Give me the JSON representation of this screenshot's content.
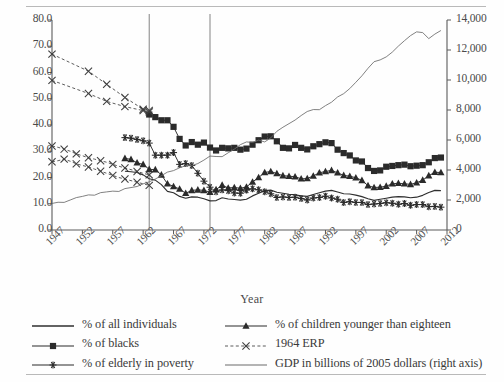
{
  "figure": {
    "axis_title": "Year",
    "left_axis": {
      "ticks": [
        "0.0",
        "10.0",
        "20.0",
        "30.0",
        "40.0",
        "50.0",
        "60.0",
        "70.0",
        "80.0"
      ],
      "min": 0,
      "max": 80,
      "step": 10
    },
    "right_axis": {
      "ticks": [
        "0",
        "2,000",
        "4,000",
        "6,000",
        "8,000",
        "10,000",
        "12,000",
        "14,000"
      ],
      "min": 0,
      "max": 14000,
      "step": 2000
    },
    "x_axis": {
      "ticks": [
        "1947",
        "1952",
        "1957",
        "1962",
        "1967",
        "1972",
        "1977",
        "1982",
        "1987",
        "1992",
        "1997",
        "2002",
        "2007",
        "2012"
      ],
      "min": 1947,
      "max": 2012,
      "step": 5
    }
  },
  "legend": {
    "column1": [
      {
        "label": "% of all individuals",
        "key": "plain-line"
      },
      {
        "label": "% of blacks",
        "key": "square-marker-line"
      },
      {
        "label": "% of elderly in poverty",
        "key": "asterisk-marker-line"
      }
    ],
    "column2": [
      {
        "label": "% of children younger than eighteen",
        "key": "triangle-marker-line"
      },
      {
        "label": "1964 ERP",
        "key": "dashed-x-marker-line"
      },
      {
        "label": "GDP in billions of 2005 dollars (right axis)",
        "key": "thin-line"
      }
    ]
  },
  "chart_data": {
    "type": "line",
    "title": "",
    "xlabel": "Year",
    "ylabel": "",
    "y2label": "",
    "xlim": [
      1947,
      2012
    ],
    "ylim": [
      0,
      80
    ],
    "y2lim": [
      0,
      14000
    ],
    "grid": false,
    "legend_position": "bottom",
    "vertical_reference_lines": [
      1963,
      1973
    ],
    "x": [
      1947,
      1948,
      1949,
      1950,
      1951,
      1952,
      1953,
      1954,
      1955,
      1956,
      1957,
      1958,
      1959,
      1960,
      1961,
      1962,
      1963,
      1964,
      1965,
      1966,
      1967,
      1968,
      1969,
      1970,
      1971,
      1972,
      1973,
      1974,
      1975,
      1976,
      1977,
      1978,
      1979,
      1980,
      1981,
      1982,
      1983,
      1984,
      1985,
      1986,
      1987,
      1988,
      1989,
      1990,
      1991,
      1992,
      1993,
      1994,
      1995,
      1996,
      1997,
      1998,
      1999,
      2000,
      2001,
      2002,
      2003,
      2004,
      2005,
      2006,
      2007,
      2008,
      2009,
      2010,
      2011
    ],
    "series": [
      {
        "name": "% of all individuals",
        "axis": "left",
        "style": "plain-line",
        "x": [
          1959,
          1960,
          1961,
          1962,
          1963,
          1964,
          1965,
          1966,
          1967,
          1968,
          1969,
          1970,
          1971,
          1972,
          1973,
          1974,
          1975,
          1976,
          1977,
          1978,
          1979,
          1980,
          1981,
          1982,
          1983,
          1984,
          1985,
          1986,
          1987,
          1988,
          1989,
          1990,
          1991,
          1992,
          1993,
          1994,
          1995,
          1996,
          1997,
          1998,
          1999,
          2000,
          2001,
          2002,
          2003,
          2004,
          2005,
          2006,
          2007,
          2008,
          2009,
          2010,
          2011
        ],
        "values": [
          22.4,
          22.2,
          21.9,
          21.0,
          19.5,
          19.0,
          17.3,
          14.7,
          14.2,
          12.8,
          12.1,
          12.6,
          12.5,
          11.9,
          11.1,
          11.2,
          12.3,
          11.8,
          11.6,
          11.4,
          11.7,
          13.0,
          14.0,
          15.0,
          15.2,
          14.4,
          14.0,
          13.6,
          13.4,
          13.0,
          12.8,
          13.5,
          14.2,
          14.8,
          15.1,
          14.5,
          13.8,
          13.7,
          13.3,
          12.7,
          11.9,
          11.3,
          11.7,
          12.1,
          12.5,
          12.7,
          12.6,
          12.3,
          12.5,
          13.2,
          14.3,
          15.1,
          15.0
        ]
      },
      {
        "name": "% of blacks",
        "axis": "left",
        "style": "square-marker-line",
        "x": [
          1963,
          1964,
          1965,
          1966,
          1967,
          1968,
          1969,
          1970,
          1971,
          1972,
          1973,
          1974,
          1975,
          1976,
          1977,
          1978,
          1979,
          1980,
          1981,
          1982,
          1983,
          1984,
          1985,
          1986,
          1987,
          1988,
          1989,
          1990,
          1991,
          1992,
          1993,
          1994,
          1995,
          1996,
          1997,
          1998,
          1999,
          2000,
          2001,
          2002,
          2003,
          2004,
          2005,
          2006,
          2007,
          2008,
          2009,
          2010,
          2011
        ],
        "values": [
          44.0,
          43.0,
          41.8,
          41.8,
          39.3,
          34.7,
          32.2,
          33.5,
          32.5,
          33.3,
          31.4,
          30.3,
          31.3,
          31.1,
          31.3,
          30.6,
          31.0,
          32.5,
          34.2,
          35.6,
          35.7,
          33.8,
          31.3,
          31.1,
          32.4,
          31.3,
          30.7,
          31.9,
          32.7,
          33.4,
          33.1,
          30.6,
          29.3,
          28.4,
          26.5,
          26.1,
          23.6,
          22.5,
          22.7,
          24.1,
          24.4,
          24.7,
          24.9,
          24.3,
          24.5,
          24.7,
          25.8,
          27.4,
          27.6
        ]
      },
      {
        "name": "% of children younger than eighteen",
        "axis": "left",
        "style": "triangle-marker-line",
        "x": [
          1959,
          1960,
          1961,
          1962,
          1963,
          1964,
          1965,
          1966,
          1967,
          1968,
          1969,
          1970,
          1971,
          1972,
          1973,
          1974,
          1975,
          1976,
          1977,
          1978,
          1979,
          1980,
          1981,
          1982,
          1983,
          1984,
          1985,
          1986,
          1987,
          1988,
          1989,
          1990,
          1991,
          1992,
          1993,
          1994,
          1995,
          1996,
          1997,
          1998,
          1999,
          2000,
          2001,
          2002,
          2003,
          2004,
          2005,
          2006,
          2007,
          2008,
          2009,
          2010,
          2011
        ],
        "values": [
          27.3,
          26.9,
          25.6,
          25.0,
          23.1,
          23.0,
          21.0,
          17.6,
          16.6,
          15.6,
          14.0,
          15.1,
          15.3,
          15.1,
          14.4,
          15.4,
          17.1,
          16.0,
          16.2,
          15.9,
          16.4,
          18.3,
          20.0,
          21.9,
          22.3,
          21.5,
          20.7,
          20.5,
          20.3,
          19.5,
          19.6,
          20.6,
          21.8,
          22.3,
          22.7,
          21.8,
          20.8,
          20.5,
          19.9,
          18.9,
          16.9,
          16.2,
          16.3,
          16.7,
          17.6,
          17.8,
          17.6,
          17.4,
          18.0,
          19.0,
          20.7,
          22.0,
          21.9
        ]
      },
      {
        "name": "% of elderly in poverty",
        "axis": "left",
        "style": "asterisk-marker-line",
        "x": [
          1959,
          1960,
          1961,
          1962,
          1963,
          1964,
          1965,
          1966,
          1967,
          1968,
          1969,
          1970,
          1971,
          1972,
          1973,
          1974,
          1975,
          1976,
          1977,
          1978,
          1979,
          1980,
          1981,
          1982,
          1983,
          1984,
          1985,
          1986,
          1987,
          1988,
          1989,
          1990,
          1991,
          1992,
          1993,
          1994,
          1995,
          1996,
          1997,
          1998,
          1999,
          2000,
          2001,
          2002,
          2003,
          2004,
          2005,
          2006,
          2007,
          2008,
          2009,
          2010,
          2011
        ],
        "values": [
          35.2,
          35.0,
          34.5,
          34.0,
          33.1,
          28.5,
          28.5,
          28.5,
          29.5,
          25.0,
          25.3,
          24.6,
          21.6,
          18.6,
          16.3,
          14.6,
          15.3,
          15.0,
          14.1,
          14.0,
          15.2,
          15.7,
          15.3,
          14.6,
          13.8,
          12.4,
          12.6,
          12.4,
          12.5,
          12.0,
          11.4,
          12.2,
          12.4,
          12.9,
          12.2,
          11.7,
          10.5,
          10.8,
          10.5,
          10.5,
          9.7,
          9.9,
          10.1,
          10.4,
          10.2,
          9.8,
          10.1,
          9.4,
          9.7,
          9.7,
          8.9,
          9.0,
          8.7
        ]
      },
      {
        "name": "1964 ERP",
        "axis": "left",
        "style": "dashed-x-marker-line",
        "sublines": [
          {
            "x": [
              1947,
              1953,
              1956,
              1959,
              1962,
              1963
            ],
            "values": [
              67.0,
              60.5,
              55.5,
              50.5,
              46.0,
              45.5
            ]
          },
          {
            "x": [
              1947,
              1953,
              1956,
              1959,
              1962,
              1963
            ],
            "values": [
              57.0,
              52.0,
              49.0,
              47.0,
              45.5,
              45.0
            ]
          },
          {
            "x": [
              1947,
              1948,
              1949,
              1950,
              1951,
              1952,
              1953,
              1954,
              1955,
              1956,
              1957,
              1958,
              1959,
              1960,
              1961,
              1962,
              1963
            ],
            "values": [
              32.0,
              31.5,
              30.8,
              30.0,
              29.0,
              28.3,
              27.5,
              27.0,
              26.4,
              25.8,
              25.0,
              24.3,
              23.6,
              23.0,
              22.3,
              21.6,
              21.0
            ]
          },
          {
            "x": [
              1947,
              1948,
              1949,
              1950,
              1951,
              1952,
              1953,
              1954,
              1955,
              1956,
              1957,
              1958,
              1959,
              1960,
              1961,
              1962,
              1963
            ],
            "values": [
              26.0,
              26.4,
              27.0,
              26.2,
              25.2,
              24.6,
              24.0,
              23.2,
              22.4,
              21.6,
              20.8,
              20.0,
              19.4,
              18.8,
              18.2,
              17.6,
              17.0
            ]
          }
        ]
      },
      {
        "name": "GDP in billions of 2005 dollars (right axis)",
        "axis": "right",
        "style": "thin-line",
        "x": [
          1947,
          1948,
          1949,
          1950,
          1951,
          1952,
          1953,
          1954,
          1955,
          1956,
          1957,
          1958,
          1959,
          1960,
          1961,
          1962,
          1963,
          1964,
          1965,
          1966,
          1967,
          1968,
          1969,
          1970,
          1971,
          1972,
          1973,
          1974,
          1975,
          1976,
          1977,
          1978,
          1979,
          1980,
          1981,
          1982,
          1983,
          1984,
          1985,
          1986,
          1987,
          1988,
          1989,
          1990,
          1991,
          1992,
          1993,
          1994,
          1995,
          1996,
          1997,
          1998,
          1999,
          2000,
          2001,
          2002,
          2003,
          2004,
          2005,
          2006,
          2007,
          2008,
          2009,
          2010,
          2011
        ],
        "values": [
          1770,
          1850,
          1840,
          2000,
          2160,
          2240,
          2340,
          2320,
          2490,
          2540,
          2590,
          2570,
          2760,
          2830,
          2900,
          3080,
          3210,
          3400,
          3620,
          3860,
          3960,
          4150,
          4280,
          4290,
          4430,
          4660,
          4930,
          4900,
          4890,
          5150,
          5390,
          5690,
          5870,
          5840,
          5990,
          5870,
          6140,
          6580,
          6850,
          7090,
          7330,
          7630,
          7900,
          8030,
          8020,
          8290,
          8520,
          8870,
          9090,
          9430,
          9850,
          10280,
          10780,
          11220,
          11340,
          11540,
          11860,
          12260,
          12620,
          12960,
          13210,
          13160,
          12760,
          13060,
          13300
        ]
      }
    ]
  }
}
